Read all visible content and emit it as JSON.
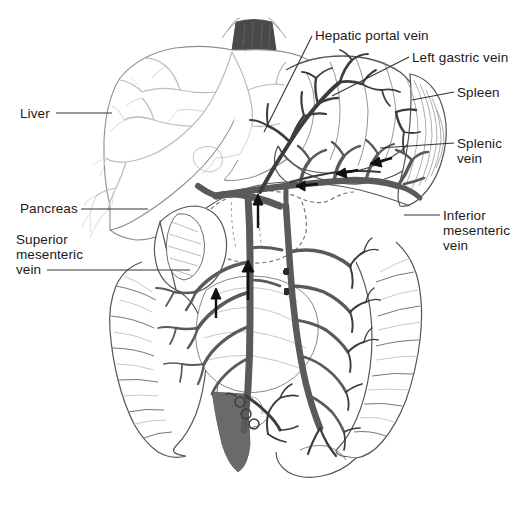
{
  "figure": {
    "background_color": "#ffffff",
    "ink_color": "#1a1a1a",
    "vein_color": "#5a5a5a",
    "organ_outline_color": "#555555",
    "liver_outline_color": "#9a9a9a",
    "esophagus_color": "#4a4a4a",
    "leader_line_color": "#333333"
  },
  "labels": {
    "liver": {
      "text": "Liver"
    },
    "pancreas": {
      "text": "Pancreas"
    },
    "superior_mesenteric_vein": {
      "line1": "Superior",
      "line2": "mesenteric",
      "line3": "vein"
    },
    "hepatic_portal_vein": {
      "text": "Hepatic portal vein"
    },
    "left_gastric_vein": {
      "text": "Left gastric vein"
    },
    "spleen": {
      "text": "Spleen"
    },
    "splenic_vein": {
      "line1": "Splenic",
      "line2": "vein"
    },
    "inferior_mesenteric_vein": {
      "line1": "Inferior",
      "line2": "mesenteric",
      "line3": "vein"
    }
  },
  "structures": [
    {
      "name": "liver",
      "label": "Liver"
    },
    {
      "name": "stomach",
      "label": "Stomach"
    },
    {
      "name": "spleen",
      "label": "Spleen"
    },
    {
      "name": "pancreas",
      "label": "Pancreas"
    },
    {
      "name": "duodenum",
      "label": "Duodenum"
    },
    {
      "name": "ascending-colon",
      "label": "Ascending colon"
    },
    {
      "name": "descending-colon",
      "label": "Descending colon"
    },
    {
      "name": "small-intestine",
      "label": "Small intestine"
    },
    {
      "name": "esophagus-stump",
      "label": "Esophagus"
    },
    {
      "name": "hepatic-portal-vein",
      "label": "Hepatic portal vein"
    },
    {
      "name": "splenic-vein",
      "label": "Splenic vein"
    },
    {
      "name": "left-gastric-vein",
      "label": "Left gastric vein"
    },
    {
      "name": "superior-mesenteric-vein",
      "label": "Superior mesenteric vein"
    },
    {
      "name": "inferior-mesenteric-vein",
      "label": "Inferior mesenteric vein"
    }
  ],
  "flow_arrows": [
    {
      "name": "splenic-flow-arrow-1",
      "direction": "left"
    },
    {
      "name": "splenic-flow-arrow-2",
      "direction": "left"
    },
    {
      "name": "splenic-flow-arrow-3",
      "direction": "left"
    },
    {
      "name": "portal-flow-arrow-up",
      "direction": "up"
    },
    {
      "name": "smv-flow-arrow-1",
      "direction": "up"
    },
    {
      "name": "smv-flow-arrow-2",
      "direction": "up"
    }
  ]
}
